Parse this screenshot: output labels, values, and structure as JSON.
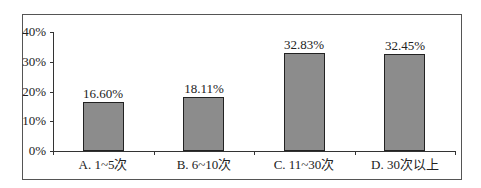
{
  "chart_data": {
    "type": "bar",
    "title": "",
    "xlabel": "",
    "ylabel": "",
    "categories": [
      "A. 1~5次",
      "B. 6~10次",
      "C. 11~30次",
      "D. 30次以上"
    ],
    "values": [
      16.6,
      18.11,
      32.83,
      32.45
    ],
    "value_labels": [
      "16.60%",
      "18.11%",
      "32.83%",
      "32.45%"
    ],
    "ylim": [
      0,
      40
    ],
    "yticks": [
      "0%",
      "10%",
      "20%",
      "30%",
      "40%"
    ],
    "grid": false,
    "legend": null,
    "bar_color": "#8c8c8c"
  }
}
